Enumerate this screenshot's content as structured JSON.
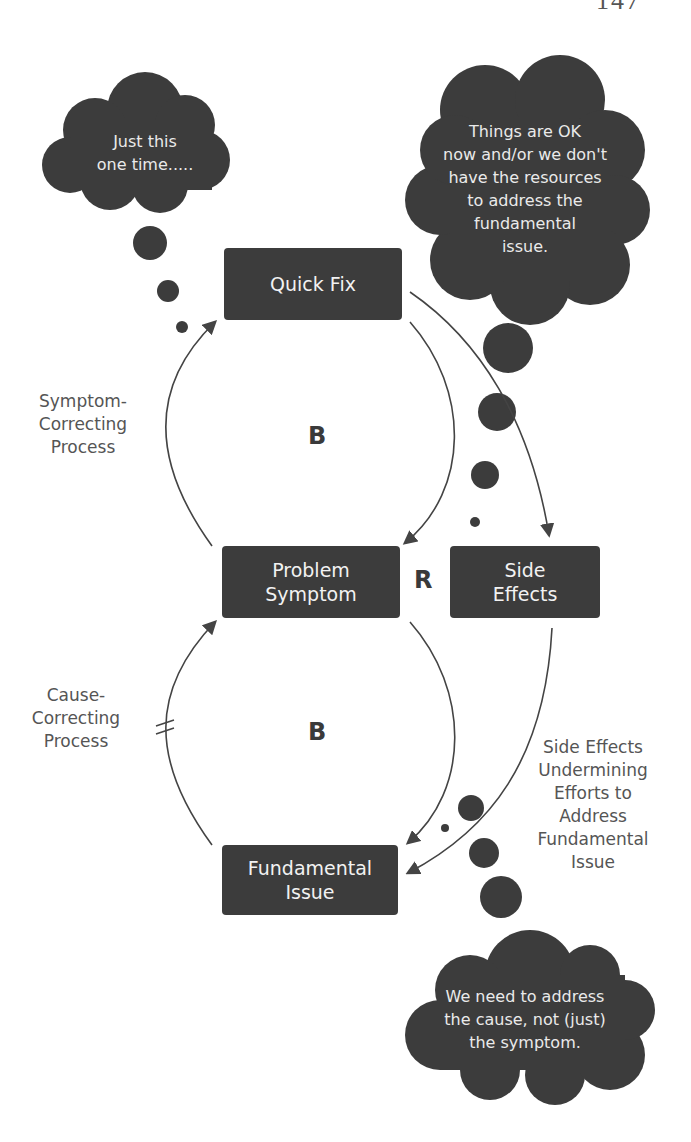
{
  "page": {
    "number": "147"
  },
  "colors": {
    "node_fill": "#3c3c3c",
    "node_text": "#f2f2f2",
    "cloud_fill": "#3c3c3c",
    "arrow": "#444444",
    "label_text": "#555555"
  },
  "nodes": {
    "quick_fix": {
      "lines": [
        "Quick Fix"
      ]
    },
    "problem_symptom": {
      "lines": [
        "Problem",
        "Symptom"
      ]
    },
    "side_effects": {
      "lines": [
        "Side",
        "Effects"
      ]
    },
    "fundamental_issue": {
      "lines": [
        "Fundamental",
        "Issue"
      ]
    }
  },
  "loops": {
    "top": "B",
    "middle": "R",
    "bottom": "B"
  },
  "labels": {
    "symptom_correcting": [
      "Symptom-",
      "Correcting",
      "Process"
    ],
    "cause_correcting": [
      "Cause-",
      "Correcting",
      "Process"
    ],
    "side_effects_undermining": [
      "Side Effects",
      "Undermining",
      "Efforts to",
      "Address",
      "Fundamental",
      "Issue"
    ]
  },
  "delay_marker": "//",
  "thought_clouds": {
    "top_left": [
      "Just this",
      "one time....."
    ],
    "top_right": [
      "Things are OK",
      "now and/or we don't",
      "have the resources",
      "to address the",
      "fundamental",
      "issue."
    ],
    "bottom": [
      "We need to address",
      "the cause, not (just)",
      "the symptom."
    ]
  }
}
